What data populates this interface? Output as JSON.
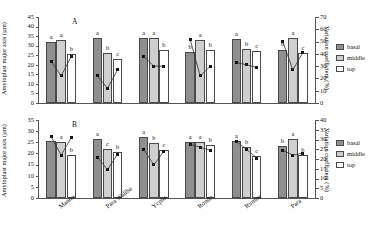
{
  "chart_data": [
    {
      "type": "bar",
      "panel": "A",
      "title": "",
      "ylabel": "Amyloplast major axis (µm)",
      "ylabel_right": "Variation coefficient (%)",
      "xlabel": "",
      "ylim": [
        0,
        45
      ],
      "yticks": [
        0,
        5,
        10,
        15,
        20,
        25,
        30,
        35,
        40,
        45
      ],
      "ylim_right": [
        0,
        70
      ],
      "yticks_right": [
        0,
        10,
        20,
        30,
        40,
        50,
        60,
        70
      ],
      "categories": [
        "Manno",
        "Para Waliba",
        "Ycpha",
        "Rondo",
        "Rumna",
        "Para"
      ],
      "series": [
        {
          "name": "basal",
          "values": [
            32.0,
            33.8,
            33.8,
            26.5,
            33.5,
            28.0
          ]
        },
        {
          "name": "middle",
          "values": [
            33.2,
            26.0,
            33.8,
            33.0,
            28.5,
            34.2
          ]
        },
        {
          "name": "top",
          "values": [
            25.5,
            23.0,
            27.5,
            27.5,
            27.0,
            26.0
          ]
        }
      ],
      "cv_series": [
        {
          "name": "basal",
          "values": [
            34.0,
            22.0,
            38.0,
            52.0,
            33.0,
            50.0
          ]
        },
        {
          "name": "middle",
          "values": [
            22.0,
            12.0,
            30.0,
            22.0,
            31.0,
            27.0
          ]
        },
        {
          "name": "top",
          "values": [
            38.0,
            27.0,
            30.0,
            30.0,
            29.0,
            41.0
          ]
        }
      ],
      "letters": [
        [
          "a",
          "a",
          "b"
        ],
        [
          "a",
          "b",
          "c"
        ],
        [
          "a",
          "a",
          "b"
        ],
        [
          "b",
          "a",
          "b"
        ],
        [
          "a",
          "b",
          "c"
        ],
        [
          "b",
          "a",
          "c"
        ]
      ]
    },
    {
      "type": "bar",
      "panel": "B",
      "title": "",
      "ylabel": "Amyloplast major axis (µm)",
      "ylabel_right": "Variation coefficient (%)",
      "xlabel": "",
      "ylim": [
        0,
        35
      ],
      "yticks": [
        0,
        5,
        10,
        15,
        20,
        25,
        30,
        35
      ],
      "ylim_right": [
        0,
        40
      ],
      "yticks_right": [
        0,
        5,
        10,
        15,
        20,
        25,
        30,
        35,
        40
      ],
      "categories": [
        "Manno",
        "Para Waliba",
        "Ycpha",
        "Rondo",
        "Rumna",
        "Para"
      ],
      "series": [
        {
          "name": "basal",
          "values": [
            25.5,
            26.5,
            27.5,
            25.0,
            25.5,
            23.5
          ]
        },
        {
          "name": "middle",
          "values": [
            25.0,
            22.0,
            24.5,
            25.0,
            23.0,
            26.5
          ]
        },
        {
          "name": "top",
          "values": [
            19.5,
            20.5,
            21.5,
            24.0,
            19.0,
            19.5
          ]
        }
      ],
      "cv_series": [
        {
          "name": "basal",
          "values": [
            31.5,
            21.0,
            25.0,
            27.5,
            29.0,
            24.5
          ]
        },
        {
          "name": "middle",
          "values": [
            22.0,
            14.5,
            17.0,
            26.0,
            25.0,
            22.0
          ]
        },
        {
          "name": "top",
          "values": [
            31.0,
            22.5,
            24.0,
            24.5,
            20.5,
            23.0
          ]
        }
      ],
      "letters": [
        [
          "a",
          "a",
          "b"
        ],
        [
          "a",
          "c",
          "b"
        ],
        [
          "a",
          "b",
          "c"
        ],
        [
          "a",
          "a",
          "b"
        ],
        [
          "a",
          "b",
          "c"
        ],
        [
          "b",
          "a",
          "b"
        ]
      ]
    }
  ],
  "legend": {
    "items": [
      {
        "key": "basal",
        "label": "basal",
        "color": "#8f8f8f"
      },
      {
        "key": "middle",
        "label": "middle",
        "color": "#cfcfcf"
      },
      {
        "key": "top",
        "label": "top",
        "color": "#ffffff"
      }
    ]
  }
}
